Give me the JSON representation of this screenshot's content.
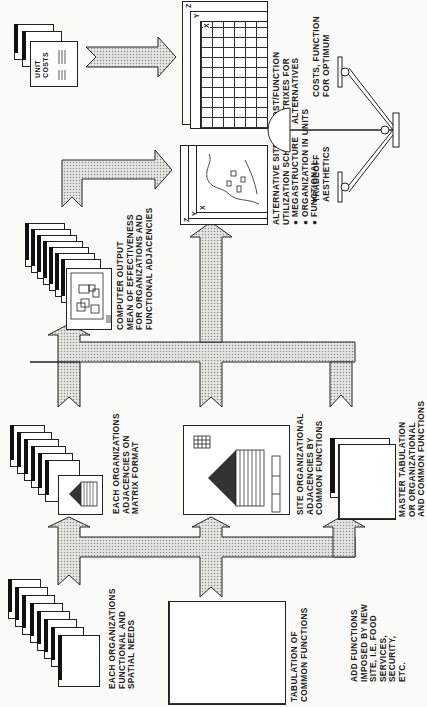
{
  "diagram": {
    "orientation": "rotated-90-ccw",
    "nodes": {
      "functional_needs": {
        "label_lines": [
          "EACH ORGANIZATIONS",
          "FUNCTIONAL AND",
          "SPATIAL NEEDS"
        ],
        "tabs": [
          "A",
          "B",
          "C",
          "D",
          "E",
          "F",
          "G",
          "H"
        ]
      },
      "adjacencies_matrix": {
        "label_lines": [
          "EACH ORGANIZATIONS",
          "ADJACENCIES ON",
          "MATRIX FORMAT"
        ]
      },
      "common_tabulation": {
        "label_lines": [
          "TABULATION OF",
          "COMMON FUNCTIONS"
        ],
        "columns": [
          "A",
          "B",
          "C",
          "D",
          "E",
          "F",
          "G",
          "H"
        ]
      },
      "site_adjacencies": {
        "label_lines": [
          "SITE ORGANIZATIONAL",
          "ADJACENCIES BY",
          "COMMON FUNCTIONS"
        ]
      },
      "added_functions": {
        "label_lines": [
          "ADD FUNCTIONS",
          "IMPOSED BY NEW",
          "SITE, I.E. FOOD",
          "SERVICES,",
          "SECURITY,",
          "ETC."
        ]
      },
      "master_tabulation": {
        "label_lines": [
          "MASTER TABULATION",
          "OR ORGANIZATIONAL",
          "AND COMMON FUNCTIONS"
        ]
      },
      "computer_output": {
        "label_lines": [
          "COMPUTER OUTPUT",
          "MEAN OF EFFECTIVENESS",
          "FOR ORGANIZATIONS AND",
          "FUNCTIONAL ADJACENCIES"
        ]
      },
      "site_schemes": {
        "label_lines": [
          "ALTERNATIVE SITE",
          "UTILIZATION SCHEMES"
        ],
        "bullets": [
          "MEGASTRUCTURE",
          "ORGANIZATION IN UNITS",
          "FUNCTIONAL"
        ],
        "sheet_tags": [
          "Z",
          "Y",
          "X"
        ]
      },
      "unit_costs": {
        "label_lines": [
          "UNIT",
          "COSTS"
        ]
      },
      "cost_matrices": {
        "label_lines": [
          "COST/FUNCTION",
          "MATRIXES FOR",
          "ALTERNATIVES"
        ],
        "sheet_tags": [
          "Z",
          "Y",
          "X"
        ]
      },
      "tradeoff_balance": {
        "left_label_lines": [
          "TRADEOFF",
          "AESTHETICS"
        ],
        "right_label_lines": [
          "COSTS, FUNCTION",
          "FOR OPTIMUM"
        ]
      }
    },
    "colors": {
      "ink": "#1a1a1a",
      "arrow_fill": "#e4e4e0",
      "paper": "#fbfbf9"
    }
  }
}
